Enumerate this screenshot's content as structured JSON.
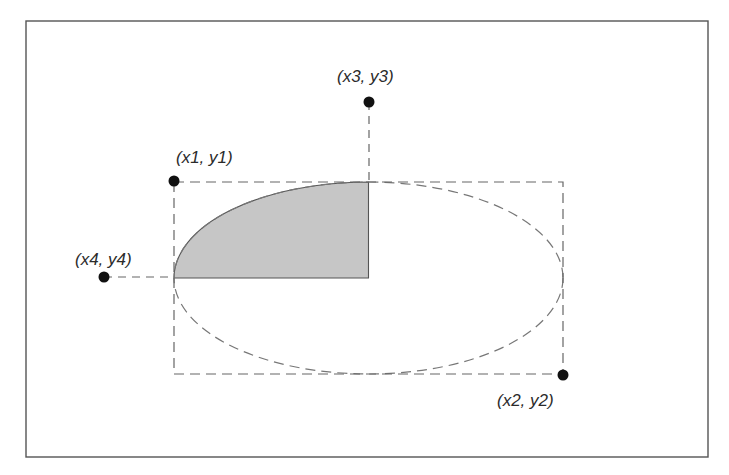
{
  "figure": {
    "frame": {
      "x": 26,
      "y": 21,
      "width": 682,
      "height": 436,
      "stroke": "#555555"
    },
    "bounding_rect": {
      "x": 174,
      "y": 182,
      "width": 389,
      "height": 192,
      "stroke": "#666666",
      "dash": "10,6"
    },
    "ellipse": {
      "cx": 368.5,
      "cy": 278,
      "rx": 194.5,
      "ry": 96,
      "stroke": "#777777",
      "dash": "10,6"
    },
    "wedge": {
      "fill": "#c6c6c6",
      "stroke": "#555555",
      "from_angle_deg": 90,
      "to_angle_deg": 180
    },
    "points": [
      {
        "id": "p1",
        "label": "(x1, y1)",
        "x": 174,
        "y": 181,
        "label_x": 176,
        "label_y": 163
      },
      {
        "id": "p2",
        "label": "(x2, y2)",
        "x": 563,
        "y": 375,
        "label_x": 497,
        "label_y": 406
      },
      {
        "id": "p3",
        "label": "(x3, y3)",
        "x": 369,
        "y": 102,
        "label_x": 337,
        "label_y": 82
      },
      {
        "id": "p4",
        "label": "(x4, y4)",
        "x": 104,
        "y": 277,
        "label_x": 75,
        "label_y": 265
      }
    ],
    "colors": {
      "point": "#111111",
      "guide": "#666666",
      "text": "#2b2b2b",
      "fill": "#c6c6c6"
    }
  }
}
